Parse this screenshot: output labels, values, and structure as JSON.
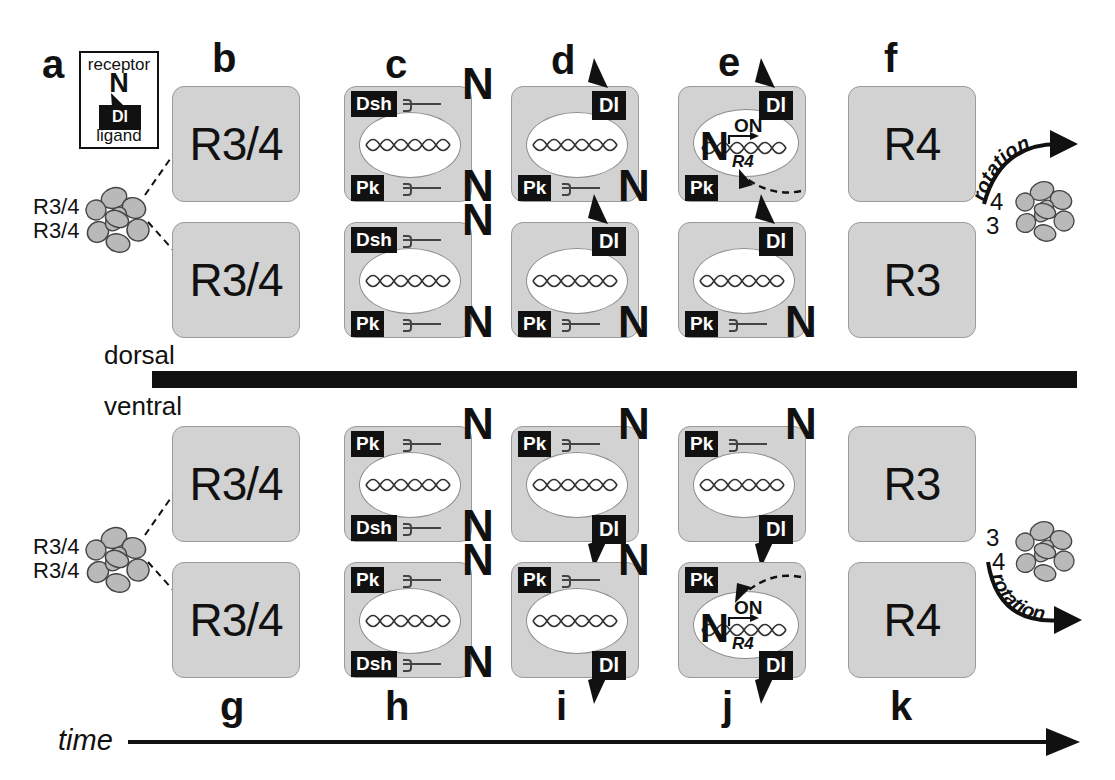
{
  "figure": {
    "time_axis_label": "time",
    "dorsal_label": "dorsal",
    "ventral_label": "ventral",
    "colors": {
      "cell_fill": "#d2d2d2",
      "cell_stroke": "#9a9a9a",
      "tag_fill": "#111111",
      "tag_text": "#ffffff",
      "nucleus_fill": "#ffffff",
      "ink": "#111111",
      "ommatidium_fill": "#b9b9b9"
    }
  },
  "legend": {
    "panel_letter": "a",
    "top_text": "receptor",
    "receptor_symbol": "N",
    "ligand_symbol": "Dl",
    "bottom_text": "ligand"
  },
  "panel_letters": {
    "dorsal": [
      "a",
      "b",
      "c",
      "d",
      "e",
      "f"
    ],
    "ventral": [
      "g",
      "h",
      "i",
      "j",
      "k"
    ]
  },
  "ommatidia": {
    "dorsal": {
      "labels": [
        "R3/4",
        "R3/4"
      ],
      "rotation_label": "rotation",
      "rotation_numbers": [
        "4",
        "3"
      ]
    },
    "ventral": {
      "labels": [
        "R3/4",
        "R3/4"
      ],
      "rotation_label": "rotation",
      "rotation_numbers": [
        "3",
        "4"
      ]
    }
  },
  "dorsal_row": {
    "b": {
      "letter": "b",
      "cells": [
        {
          "label": "R3/4"
        },
        {
          "label": "R3/4"
        }
      ]
    },
    "c": {
      "letter": "c",
      "cells": [
        {
          "top_tag": "Dsh",
          "top_receptor": "N",
          "bottom_tag": "Pk",
          "bottom_receptor": "N",
          "nucleus": true
        },
        {
          "top_tag": "Dsh",
          "top_receptor": "N",
          "bottom_tag": "Pk",
          "bottom_receptor": "N",
          "nucleus": true
        }
      ]
    },
    "d": {
      "letter": "d",
      "cells": [
        {
          "top_tag": "Dl",
          "bottom_tag": "Pk",
          "bottom_receptor": "N",
          "nucleus": true
        },
        {
          "top_tag": "Dl",
          "bottom_tag": "Pk",
          "bottom_receptor": "N",
          "nucleus": true
        }
      ]
    },
    "e": {
      "letter": "e",
      "cells": [
        {
          "top_tag": "Dl",
          "bottom_tag": "Pk",
          "nucleus": true,
          "active": true,
          "nucleus_receptor": "N",
          "on_label": "ON",
          "gene_label": "R4"
        },
        {
          "top_tag": "Dl",
          "bottom_tag": "Pk",
          "bottom_receptor": "N",
          "nucleus": true,
          "active": false
        }
      ]
    },
    "f": {
      "letter": "f",
      "cells": [
        {
          "label": "R4"
        },
        {
          "label": "R3"
        }
      ]
    }
  },
  "ventral_row": {
    "g": {
      "letter": "g",
      "cells": [
        {
          "label": "R3/4"
        },
        {
          "label": "R3/4"
        }
      ]
    },
    "h": {
      "letter": "h",
      "cells": [
        {
          "top_tag": "Pk",
          "top_receptor": "N",
          "bottom_tag": "Dsh",
          "bottom_receptor": "N",
          "nucleus": true
        },
        {
          "top_tag": "Pk",
          "top_receptor": "N",
          "bottom_tag": "Dsh",
          "bottom_receptor": "N",
          "nucleus": true
        }
      ]
    },
    "i": {
      "letter": "i",
      "cells": [
        {
          "top_tag": "Pk",
          "top_receptor": "N",
          "bottom_tag": "Dl",
          "nucleus": true
        },
        {
          "top_tag": "Pk",
          "top_receptor": "N",
          "bottom_tag": "Dl",
          "nucleus": true
        }
      ]
    },
    "j": {
      "letter": "j",
      "cells": [
        {
          "top_tag": "Pk",
          "top_receptor": "N",
          "bottom_tag": "Dl",
          "nucleus": true,
          "active": false
        },
        {
          "top_tag": "Pk",
          "bottom_tag": "Dl",
          "nucleus": true,
          "active": true,
          "nucleus_receptor": "N",
          "on_label": "ON",
          "gene_label": "R4"
        }
      ]
    },
    "k": {
      "letter": "k",
      "cells": [
        {
          "label": "R3"
        },
        {
          "label": "R4"
        }
      ]
    }
  }
}
